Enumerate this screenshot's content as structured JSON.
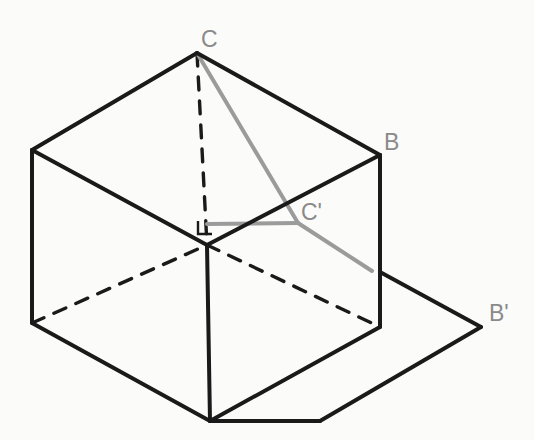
{
  "figure": {
    "background_color": "#fbfbfa",
    "solid_edge_color": "#1a1a1a",
    "hidden_edge_color": "#1a1a1a",
    "projection_line_color": "#9b9b9b",
    "label_color": "#8a8a8a",
    "solid_edge_width": 4,
    "hidden_edge_width": 3.4,
    "projection_line_width": 4
  },
  "labels": [
    {
      "id": "label-C",
      "text": "C",
      "x": 201,
      "y": 28,
      "name": "vertex-label-c"
    },
    {
      "id": "label-B",
      "text": "B",
      "x": 384,
      "y": 131,
      "name": "vertex-label-b"
    },
    {
      "id": "label-Cprime",
      "text": "C'",
      "x": 301,
      "y": 201,
      "name": "vertex-label-c-prime"
    },
    {
      "id": "label-Bprime",
      "text": "B'",
      "x": 489,
      "y": 302,
      "name": "vertex-label-b-prime"
    }
  ],
  "points": {
    "C": {
      "x": 197,
      "y": 53,
      "label": "C"
    },
    "top_left": {
      "x": 32,
      "y": 150,
      "label": ""
    },
    "B": {
      "x": 380,
      "y": 155,
      "label": "B"
    },
    "center": {
      "x": 207,
      "y": 245,
      "label": ""
    },
    "C_prime": {
      "x": 298,
      "y": 223,
      "label": "C'"
    },
    "bot_left": {
      "x": 32,
      "y": 323,
      "label": ""
    },
    "bot_right": {
      "x": 380,
      "y": 327,
      "label": ""
    },
    "bottom": {
      "x": 210,
      "y": 421,
      "label": ""
    },
    "shadow_near": {
      "x": 320,
      "y": 421,
      "label": ""
    },
    "shadow_top": {
      "x": 380,
      "y": 272,
      "label": ""
    },
    "B_prime": {
      "x": 481,
      "y": 327,
      "label": "B'"
    },
    "ray_end": {
      "x": 372,
      "y": 271,
      "label": ""
    }
  },
  "shapes": {
    "cube_top_face": "197,53 32,150 207,245 380,155",
    "cube_left_face": "32,150 32,323 210,421 207,245",
    "cube_front_face": "207,245 210,421 380,327 380,155",
    "shadow_plane": "380,272 481,327 320,421 210,421",
    "solid_edges": [
      {
        "name": "edge-c-to-top-left",
        "x1": 197,
        "y1": 53,
        "x2": 32,
        "y2": 150
      },
      {
        "name": "edge-c-to-b",
        "x1": 197,
        "y1": 53,
        "x2": 380,
        "y2": 155
      },
      {
        "name": "edge-top-left-to-center",
        "x1": 32,
        "y1": 150,
        "x2": 207,
        "y2": 245
      },
      {
        "name": "edge-b-to-center",
        "x1": 380,
        "y1": 155,
        "x2": 207,
        "y2": 245
      },
      {
        "name": "edge-top-left-vertical",
        "x1": 32,
        "y1": 150,
        "x2": 32,
        "y2": 323
      },
      {
        "name": "edge-b-vertical",
        "x1": 380,
        "y1": 155,
        "x2": 380,
        "y2": 327
      },
      {
        "name": "edge-center-vertical",
        "x1": 207,
        "y1": 245,
        "x2": 210,
        "y2": 421
      },
      {
        "name": "edge-bot-left-to-bottom",
        "x1": 32,
        "y1": 323,
        "x2": 210,
        "y2": 421
      },
      {
        "name": "edge-bottom-to-bot-right",
        "x1": 210,
        "y1": 421,
        "x2": 380,
        "y2": 327
      },
      {
        "name": "shadow-edge-near",
        "x1": 210,
        "y1": 421,
        "x2": 320,
        "y2": 421
      },
      {
        "name": "shadow-edge-to-bprime",
        "x1": 320,
        "y1": 421,
        "x2": 481,
        "y2": 327
      },
      {
        "name": "shadow-edge-bprime-up",
        "x1": 481,
        "y1": 327,
        "x2": 380,
        "y2": 272
      }
    ],
    "hidden_edges": [
      {
        "name": "hidden-edge-c-vertical",
        "x1": 197,
        "y1": 53,
        "x2": 207,
        "y2": 245
      },
      {
        "name": "hidden-edge-bot-left-diagonal",
        "x1": 32,
        "y1": 323,
        "x2": 207,
        "y2": 245
      },
      {
        "name": "hidden-edge-bot-right-diagonal",
        "x1": 207,
        "y1": 245,
        "x2": 380,
        "y2": 327
      }
    ],
    "projection_lines": [
      {
        "name": "projection-line-c-to-cprime",
        "x1": 197,
        "y1": 53,
        "x2": 298,
        "y2": 223
      },
      {
        "name": "projection-line-center-to-cprime",
        "x1": 207,
        "y1": 224,
        "x2": 298,
        "y2": 223
      },
      {
        "name": "projection-line-cprime-to-ray-end",
        "x1": 298,
        "y1": 223,
        "x2": 372,
        "y2": 271
      }
    ],
    "right_angle_mark": "198,221 198,234 212,234"
  }
}
